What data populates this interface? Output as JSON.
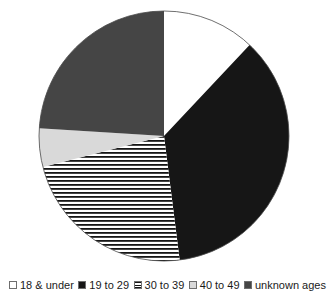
{
  "page": {
    "background": "#ffffff"
  },
  "chart_data": {
    "type": "pie",
    "title": "",
    "legend_position": "bottom",
    "direction": "clockwise",
    "start_angle_deg": 0,
    "categories": [
      "18 & under",
      "19 to 29",
      "30 to 39",
      "40 to 49",
      "unknown ages"
    ],
    "values": [
      12,
      36,
      23,
      5,
      24
    ],
    "values_unit": "percent of circle (estimated from slice angles)",
    "outline_color": "#4a4a4a",
    "slices": [
      {
        "label": "18 & under",
        "value_pct": 12,
        "fill": "#ffffff",
        "pattern": "none"
      },
      {
        "label": "19 to 29",
        "value_pct": 36,
        "fill": "#161616",
        "pattern": "none"
      },
      {
        "label": "30 to 39",
        "value_pct": 23,
        "fill": "#ffffff",
        "pattern": "horizontal-stripes",
        "pattern_line_color": "#161616"
      },
      {
        "label": "40 to 49",
        "value_pct": 5,
        "fill": "#d9d9d9",
        "pattern": "none"
      },
      {
        "label": "unknown ages",
        "value_pct": 24,
        "fill": "#454545",
        "pattern": "none"
      }
    ],
    "legend": {
      "text_color": "#1a1a1a"
    }
  }
}
